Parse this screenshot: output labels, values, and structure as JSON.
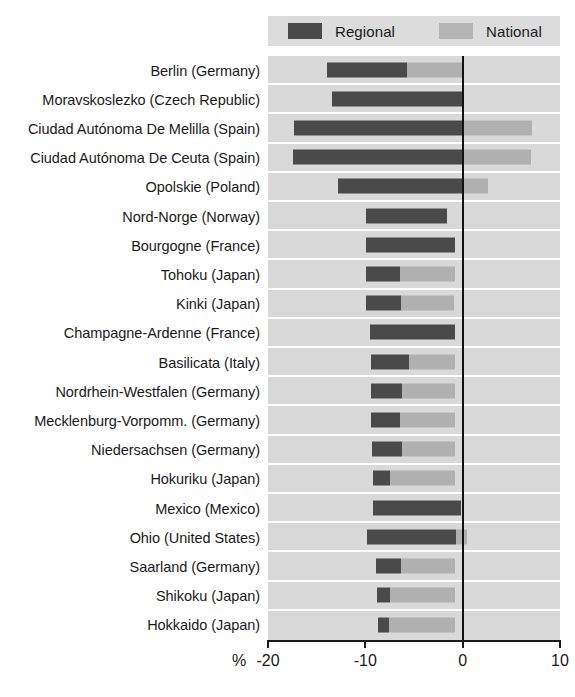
{
  "title_remnant": "",
  "legend": {
    "position": "top-right",
    "entries": [
      {
        "label": "Regional",
        "color": "#4a4a4a",
        "icon": "square-swatch-icon"
      },
      {
        "label": "National",
        "color": "#b0b0b0",
        "icon": "square-swatch-icon"
      }
    ]
  },
  "axis": {
    "unit": "%",
    "ticks": [
      "-20",
      "-10",
      "0",
      "10"
    ]
  },
  "colors": {
    "regional": "#4a4a4a",
    "national": "#b0b0b0",
    "plot_background": "#d9d9d9",
    "legend_background": "#dcdcdc",
    "gridline": "#ffffff",
    "zero_line": "#111111",
    "text": "#1a1a1a"
  },
  "chart_data": {
    "type": "bar",
    "orientation": "horizontal",
    "title": "",
    "subtitle": "",
    "xlabel": "%",
    "ylabel": "",
    "xlim": [
      -20,
      10
    ],
    "xticks": [
      -20,
      -10,
      0,
      10
    ],
    "grid": true,
    "legend_position": "top-right",
    "note": "Floating/stacked horizontal bars: each region's dark 'Regional' segment spans from its start to its end value; the light 'National' segment continues from the regional end to the national end value.",
    "categories": [
      "Berlin (Germany)",
      "Moravskoslezko (Czech Republic)",
      "Ciudad Autónoma De Melilla  (Spain)",
      "Ciudad Autónoma De Ceuta (Spain)",
      "Opolskie (Poland)",
      "Nord-Norge (Norway)",
      "Bourgogne (France)",
      "Tohoku (Japan)",
      "Kinki (Japan)",
      "Champagne-Ardenne (France)",
      "Basilicata (Italy)",
      "Nordrhein-Westfalen (Germany)",
      "Mecklenburg-Vorpomm. (Germany)",
      "Niedersachsen (Germany)",
      "Hokuriku (Japan)",
      "Mexico (Mexico)",
      "Ohio (United States)",
      "Saarland (Germany)",
      "Shikoku (Japan)",
      "Hokkaido (Japan)"
    ],
    "series": [
      {
        "name": "Regional",
        "color": "#4a4a4a",
        "starts": [
          -13.9,
          -13.4,
          -17.3,
          -17.4,
          -12.8,
          -9.9,
          -9.9,
          -9.9,
          -9.9,
          -9.5,
          -9.4,
          -9.4,
          -9.4,
          -9.3,
          -9.2,
          -9.2,
          -9.8,
          -8.9,
          -8.8,
          -8.7
        ],
        "ends": [
          -5.7,
          -0.1,
          0.0,
          0.0,
          -0.1,
          -1.6,
          -0.8,
          -6.4,
          -6.3,
          -0.8,
          -5.5,
          -6.2,
          -6.4,
          -6.2,
          -7.5,
          -0.2,
          -0.7,
          -6.3,
          -7.5,
          -7.6
        ]
      },
      {
        "name": "National",
        "color": "#b0b0b0",
        "starts": [
          -5.7,
          -0.1,
          0.0,
          0.0,
          -0.1,
          -1.6,
          -0.8,
          -6.4,
          -6.3,
          -0.8,
          -5.5,
          -6.2,
          -6.4,
          -6.2,
          -7.5,
          -0.2,
          -0.7,
          -6.3,
          -7.5,
          -7.6
        ],
        "ends": [
          0.0,
          -0.1,
          7.1,
          7.0,
          2.6,
          -1.6,
          -0.8,
          -0.8,
          -0.9,
          -0.8,
          -0.8,
          -0.8,
          -0.8,
          -0.8,
          -0.8,
          -0.2,
          0.4,
          -0.8,
          -0.8,
          -0.8
        ]
      }
    ]
  }
}
